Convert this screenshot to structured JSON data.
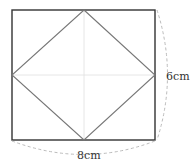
{
  "diagram": {
    "width_label": "8cm",
    "height_label": "6cm",
    "colors": {
      "rect": "#333333",
      "diamond": "#666666",
      "guide": "#dddddd",
      "dash": "#bbbbbb"
    }
  }
}
